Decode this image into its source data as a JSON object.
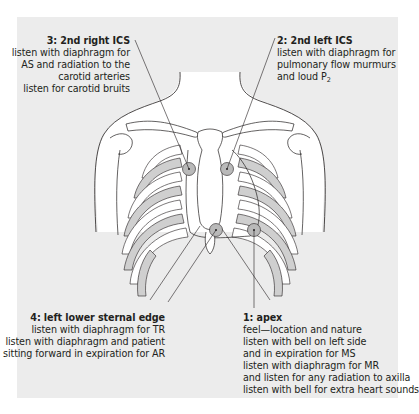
{
  "figure": {
    "type": "auscultation-sites-diagram",
    "colors": {
      "panel_bg": "#ececec",
      "body_fill": "#ffffff",
      "rib_shade": "#cfcfcf",
      "site_marker": "#b9b9b9",
      "line": "#231f20"
    },
    "sites": [
      {
        "title": "3: 2nd right ICS",
        "lines": [
          "listen with diaphragm for",
          "AS and radiation to the",
          "carotid arteries",
          "listen for carotid bruits"
        ]
      },
      {
        "title": "2: 2nd left ICS",
        "lines": [
          "listen with diaphragm for",
          "pulmonary flow murmurs",
          "and loud P"
        ],
        "subscript": "2"
      },
      {
        "title": "4: left lower sternal edge",
        "lines": [
          "listen with diaphragm for TR",
          "listen with diaphragm and patient",
          "sitting forward in expiration for AR"
        ]
      },
      {
        "title": "1: apex",
        "lines": [
          "feel—location and nature",
          "listen with bell on left side",
          "and in expiration for MS",
          "listen with diaphragm for MR",
          "and listen for any radiation to axilla",
          "listen with bell for extra heart sounds"
        ]
      }
    ]
  }
}
